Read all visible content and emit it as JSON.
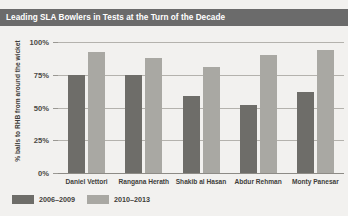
{
  "title": "Leading SLA Bowlers in Tests at the Turn of the Decade",
  "chart_data": {
    "type": "bar",
    "title": "Leading SLA Bowlers in Tests at the Turn of the Decade",
    "xlabel": "",
    "ylabel": "% balls to RHB from around the wicket",
    "categories": [
      "Daniel Vettori",
      "Rangana Herath",
      "Shakib al Hasan",
      "Abdur Rehman",
      "Monty Panesar"
    ],
    "series": [
      {
        "name": "2006–2009",
        "color": "#6e6d69",
        "values": [
          75,
          75,
          59,
          52,
          62
        ]
      },
      {
        "name": "2010–2013",
        "color": "#a9a8a3",
        "values": [
          92,
          88,
          81,
          90,
          94
        ]
      }
    ],
    "ylim": [
      0,
      100
    ],
    "yticks": [
      0,
      25,
      50,
      75,
      100
    ],
    "ytick_labels": [
      "0%",
      "25%",
      "50%",
      "75%",
      "100%"
    ],
    "grid": true,
    "legend_position": "bottom-left"
  },
  "colors": {
    "background": "#f2f1ef",
    "title_bar": "#6b6b6b",
    "title_text": "#ffffff",
    "series_1": "#6e6d69",
    "series_2": "#a9a8a3",
    "gridline": "#b4b2ad",
    "axis": "#8d8b86",
    "text": "#3f3e3b"
  }
}
